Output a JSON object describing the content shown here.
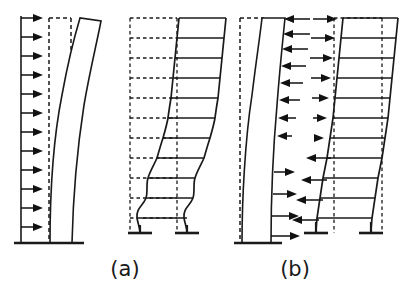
{
  "figure": {
    "background_color": "#ffffff",
    "line_color": "#1a1a1a",
    "width": 415,
    "height": 292
  },
  "captions": [
    {
      "id": "caption-a",
      "label": "(a)",
      "x": 125,
      "y": 276
    },
    {
      "id": "caption-b",
      "label": "(b)",
      "x": 295,
      "y": 276
    }
  ],
  "panels": [
    {
      "id": "panel-1",
      "group": "(a)",
      "type": "shear-wall",
      "description": "Cantilever shear wall under uniform lateral load, flexural (bending) deformation",
      "load_direction": "right",
      "arrow_count": 12,
      "deformed_shape": "flexural",
      "undeformed_outline": "dashed"
    },
    {
      "id": "panel-2",
      "group": "(a)",
      "type": "moment-frame",
      "description": "Moment frame, shear deformation mode with plastic hinges at base columns",
      "load_direction": "none-shown",
      "story_count": 11,
      "bay_count": 1,
      "deformed_shape": "shear",
      "undeformed_outline": "dashed"
    },
    {
      "id": "panel-3",
      "group": "(b)",
      "type": "shear-wall",
      "description": "Shear wall with interaction forces, upper forces acting leftward and lower forces acting rightward",
      "upper_arrow_direction": "left",
      "upper_arrow_count": 8,
      "lower_arrow_direction": "right",
      "lower_arrow_count": 4,
      "deformed_shape": "flexural",
      "undeformed_outline": "dashed"
    },
    {
      "id": "panel-4",
      "group": "(b)",
      "type": "moment-frame",
      "description": "Moment frame with interaction forces, upper forces acting rightward and lower forces acting leftward",
      "upper_arrow_direction": "right",
      "upper_arrow_count": 7,
      "lower_arrow_direction": "left",
      "lower_arrow_count": 4,
      "story_count": 11,
      "bay_count": 1,
      "deformed_shape": "shear",
      "undeformed_outline": "dashed"
    }
  ],
  "legend_notes": {
    "dashed_meaning": "undeformed / original position",
    "solid_meaning": "deformed shape",
    "arrow_meaning": "lateral load or interaction force"
  }
}
